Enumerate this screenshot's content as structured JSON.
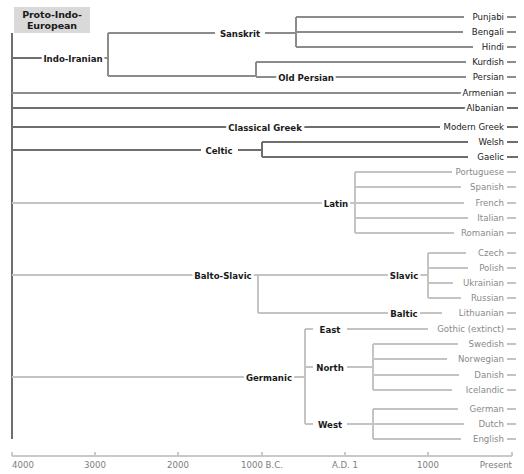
{
  "figure": {
    "root_label": "Proto-Indo-European",
    "root_box": {
      "x": 14,
      "y": 7,
      "w": 76,
      "h": 26
    },
    "colors": {
      "dark_branch": "#6e6e6e",
      "mid_branch": "#8c8c8c",
      "light_branch": "#c4c4c4",
      "dark_text": "#1a1a1a",
      "light_text": "#8a8a8a",
      "axis": "#c9c9c9",
      "axis_text": "#7d7d7d",
      "root_box_bg": "#d9d9d9"
    }
  },
  "axis": {
    "y": 456,
    "x_start": 12,
    "x_end": 512,
    "ticks": [
      {
        "label": "4000",
        "x": 12,
        "anchor": "start"
      },
      {
        "label": "3000",
        "x": 95,
        "anchor": "middle"
      },
      {
        "label": "2000",
        "x": 178,
        "anchor": "middle"
      },
      {
        "label": "1000 B.C.",
        "x": 262,
        "anchor": "middle"
      },
      {
        "label": "A.D. 1",
        "x": 345,
        "anchor": "middle"
      },
      {
        "label": "1000",
        "x": 428,
        "anchor": "middle"
      },
      {
        "label": "Present",
        "x": 512,
        "anchor": "end"
      }
    ]
  },
  "tree": {
    "spine": {
      "x": 12,
      "y_top": 33,
      "y_bottom": 439,
      "color": "dark"
    },
    "branches": [
      {
        "name": "indo-iranian-stem",
        "type": "h",
        "x1": 12,
        "x2": 46,
        "y": 58,
        "w": "dark"
      },
      {
        "name": "indo-iranian-to-fork",
        "type": "h",
        "x1": 101,
        "x2": 108,
        "y": 58,
        "w": "mid"
      },
      {
        "name": "indo-iranian-fork",
        "type": "v",
        "x": 108,
        "y1": 33,
        "y2": 76,
        "w": "mid"
      },
      {
        "name": "sanskrit-stem",
        "type": "h",
        "x1": 108,
        "x2": 215,
        "y": 33,
        "w": "mid"
      },
      {
        "name": "sanskrit-to-fork",
        "type": "h",
        "x1": 265,
        "x2": 296,
        "y": 33,
        "w": "mid"
      },
      {
        "name": "indic-fork",
        "type": "v",
        "x": 296,
        "y1": 17,
        "y2": 47,
        "w": "mid"
      },
      {
        "name": "punjabi-branch",
        "type": "h",
        "x1": 296,
        "x2": 464,
        "y": 17,
        "w": "mid"
      },
      {
        "name": "bengali-branch",
        "type": "h",
        "x1": 296,
        "x2": 463,
        "y": 32,
        "w": "mid"
      },
      {
        "name": "hindi-branch",
        "type": "h",
        "x1": 296,
        "x2": 473,
        "y": 47,
        "w": "mid"
      },
      {
        "name": "iranian-branch",
        "type": "h",
        "x1": 108,
        "x2": 256,
        "y": 76,
        "w": "mid"
      },
      {
        "name": "iranian-fork",
        "type": "v",
        "x": 256,
        "y1": 62,
        "y2": 77,
        "w": "mid"
      },
      {
        "name": "kurdish-branch",
        "type": "h",
        "x1": 256,
        "x2": 466,
        "y": 62,
        "w": "mid"
      },
      {
        "name": "old-persian-stem",
        "type": "h",
        "x1": 256,
        "x2": 283,
        "y": 77,
        "w": "mid"
      },
      {
        "name": "persian-branch",
        "type": "h",
        "x1": 330,
        "x2": 466,
        "y": 77,
        "w": "mid"
      },
      {
        "name": "armenian-branch",
        "type": "h",
        "x1": 12,
        "x2": 466,
        "y": 93,
        "w": "mid"
      },
      {
        "name": "albanian-branch",
        "type": "h",
        "x1": 12,
        "x2": 470,
        "y": 108,
        "w": "dark"
      },
      {
        "name": "classical-greek-stem",
        "type": "h",
        "x1": 12,
        "x2": 228,
        "y": 127,
        "w": "dark"
      },
      {
        "name": "modern-greek-branch",
        "type": "h",
        "x1": 303,
        "x2": 440,
        "y": 127,
        "w": "dark"
      },
      {
        "name": "celtic-stem",
        "type": "h",
        "x1": 12,
        "x2": 201,
        "y": 150,
        "w": "dark"
      },
      {
        "name": "celtic-to-fork",
        "type": "h",
        "x1": 238,
        "x2": 262,
        "y": 150,
        "w": "dark"
      },
      {
        "name": "celtic-fork",
        "type": "v",
        "x": 262,
        "y1": 142,
        "y2": 157,
        "w": "dark"
      },
      {
        "name": "welsh-branch",
        "type": "h",
        "x1": 262,
        "x2": 468,
        "y": 142,
        "w": "dark"
      },
      {
        "name": "gaelic-branch",
        "type": "h",
        "x1": 262,
        "x2": 468,
        "y": 157,
        "w": "dark"
      },
      {
        "name": "latin-stem",
        "type": "h",
        "x1": 12,
        "x2": 322,
        "y": 203,
        "w": "light"
      },
      {
        "name": "latin-to-fork",
        "type": "h",
        "x1": 350,
        "x2": 355,
        "y": 203,
        "w": "light"
      },
      {
        "name": "romance-fork",
        "type": "v",
        "x": 355,
        "y1": 172,
        "y2": 233,
        "w": "light"
      },
      {
        "name": "portuguese-branch",
        "type": "h",
        "x1": 355,
        "x2": 452,
        "y": 172,
        "w": "light"
      },
      {
        "name": "spanish-branch",
        "type": "h",
        "x1": 355,
        "x2": 461,
        "y": 187,
        "w": "light"
      },
      {
        "name": "french-branch",
        "type": "h",
        "x1": 355,
        "x2": 464,
        "y": 203,
        "w": "light"
      },
      {
        "name": "italian-branch",
        "type": "h",
        "x1": 355,
        "x2": 468,
        "y": 218,
        "w": "light"
      },
      {
        "name": "romanian-branch",
        "type": "h",
        "x1": 355,
        "x2": 454,
        "y": 233,
        "w": "light"
      },
      {
        "name": "balto-slavic-stem",
        "type": "h",
        "x1": 12,
        "x2": 194,
        "y": 275,
        "w": "light"
      },
      {
        "name": "balto-slavic-to-fork",
        "type": "h",
        "x1": 253,
        "x2": 258,
        "y": 275,
        "w": "light"
      },
      {
        "name": "balto-slavic-fork",
        "type": "v",
        "x": 258,
        "y1": 275,
        "y2": 313,
        "w": "light"
      },
      {
        "name": "slavic-stem",
        "type": "h",
        "x1": 258,
        "x2": 388,
        "y": 275,
        "w": "light"
      },
      {
        "name": "slavic-to-fork",
        "type": "h",
        "x1": 420,
        "x2": 428,
        "y": 275,
        "w": "light"
      },
      {
        "name": "slavic-fork",
        "type": "v",
        "x": 428,
        "y1": 253,
        "y2": 298,
        "w": "light"
      },
      {
        "name": "czech-branch",
        "type": "h",
        "x1": 428,
        "x2": 466,
        "y": 253,
        "w": "light"
      },
      {
        "name": "polish-branch",
        "type": "h",
        "x1": 428,
        "x2": 468,
        "y": 268,
        "w": "light"
      },
      {
        "name": "ukrainian-branch",
        "type": "h",
        "x1": 428,
        "x2": 453,
        "y": 283,
        "w": "light"
      },
      {
        "name": "russian-branch",
        "type": "h",
        "x1": 428,
        "x2": 461,
        "y": 298,
        "w": "light"
      },
      {
        "name": "baltic-stem",
        "type": "h",
        "x1": 258,
        "x2": 388,
        "y": 313,
        "w": "light"
      },
      {
        "name": "lithuanian-branch",
        "type": "h",
        "x1": 420,
        "x2": 442,
        "y": 313,
        "w": "light"
      },
      {
        "name": "germanic-stem",
        "type": "h",
        "x1": 12,
        "x2": 246,
        "y": 377,
        "w": "light"
      },
      {
        "name": "germanic-to-fork",
        "type": "h",
        "x1": 292,
        "x2": 305,
        "y": 377,
        "w": "light"
      },
      {
        "name": "germanic-fork",
        "type": "v",
        "x": 305,
        "y1": 329,
        "y2": 424,
        "w": "light"
      },
      {
        "name": "east-stem",
        "type": "h",
        "x1": 305,
        "x2": 313,
        "y": 329,
        "w": "light"
      },
      {
        "name": "gothic-branch",
        "type": "h",
        "x1": 347,
        "x2": 428,
        "y": 329,
        "w": "light"
      },
      {
        "name": "north-stem",
        "type": "h",
        "x1": 305,
        "x2": 313,
        "y": 367,
        "w": "light"
      },
      {
        "name": "north-to-fork",
        "type": "h",
        "x1": 347,
        "x2": 373,
        "y": 367,
        "w": "light"
      },
      {
        "name": "north-fork",
        "type": "v",
        "x": 373,
        "y1": 344,
        "y2": 390,
        "w": "light"
      },
      {
        "name": "swedish-branch",
        "type": "h",
        "x1": 373,
        "x2": 458,
        "y": 344,
        "w": "light"
      },
      {
        "name": "norwegian-branch",
        "type": "h",
        "x1": 373,
        "x2": 447,
        "y": 359,
        "w": "light"
      },
      {
        "name": "danish-branch",
        "type": "h",
        "x1": 373,
        "x2": 459,
        "y": 375,
        "w": "light"
      },
      {
        "name": "icelandic-branch",
        "type": "h",
        "x1": 373,
        "x2": 452,
        "y": 390,
        "w": "light"
      },
      {
        "name": "west-stem",
        "type": "h",
        "x1": 305,
        "x2": 313,
        "y": 424,
        "w": "light"
      },
      {
        "name": "west-to-fork",
        "type": "h",
        "x1": 347,
        "x2": 373,
        "y": 424,
        "w": "light"
      },
      {
        "name": "west-fork",
        "type": "v",
        "x": 373,
        "y1": 409,
        "y2": 439,
        "w": "light"
      },
      {
        "name": "german-branch",
        "type": "h",
        "x1": 373,
        "x2": 458,
        "y": 409,
        "w": "light"
      },
      {
        "name": "dutch-branch",
        "type": "h",
        "x1": 373,
        "x2": 464,
        "y": 424,
        "w": "light"
      },
      {
        "name": "english-branch",
        "type": "h",
        "x1": 373,
        "x2": 461,
        "y": 439,
        "w": "light"
      }
    ],
    "internal_nodes": [
      {
        "name": "indo-iranian",
        "label": "Indo-Iranian",
        "x": 73,
        "y": 58,
        "tone": "dark"
      },
      {
        "name": "sanskrit",
        "label": "Sanskrit",
        "x": 240,
        "y": 33,
        "tone": "dark"
      },
      {
        "name": "old-persian",
        "label": "Old Persian",
        "x": 306,
        "y": 77,
        "tone": "dark"
      },
      {
        "name": "classical-greek",
        "label": "Classical Greek",
        "x": 265,
        "y": 127,
        "tone": "dark"
      },
      {
        "name": "celtic",
        "label": "Celtic",
        "x": 219,
        "y": 150,
        "tone": "dark"
      },
      {
        "name": "latin",
        "label": "Latin",
        "x": 336,
        "y": 203,
        "tone": "dark"
      },
      {
        "name": "balto-slavic",
        "label": "Balto-Slavic",
        "x": 223,
        "y": 275,
        "tone": "dark"
      },
      {
        "name": "slavic",
        "label": "Slavic",
        "x": 404,
        "y": 275,
        "tone": "dark"
      },
      {
        "name": "baltic",
        "label": "Baltic",
        "x": 404,
        "y": 313,
        "tone": "dark"
      },
      {
        "name": "germanic",
        "label": "Germanic",
        "x": 269,
        "y": 377,
        "tone": "dark"
      },
      {
        "name": "east",
        "label": "East",
        "x": 330,
        "y": 329,
        "tone": "dark"
      },
      {
        "name": "north",
        "label": "North",
        "x": 330,
        "y": 367,
        "tone": "dark"
      },
      {
        "name": "west",
        "label": "West",
        "x": 330,
        "y": 424,
        "tone": "dark"
      }
    ],
    "leaves": [
      {
        "name": "punjabi",
        "label": "Punjabi",
        "y": 17,
        "text_x": 504,
        "tick_x1": 507,
        "tick_x2": 516,
        "tone": "mid"
      },
      {
        "name": "bengali",
        "label": "Bengali",
        "y": 32,
        "text_x": 504,
        "tick_x1": 507,
        "tick_x2": 516,
        "tone": "mid"
      },
      {
        "name": "hindi",
        "label": "Hindi",
        "y": 47,
        "text_x": 504,
        "tick_x1": 507,
        "tick_x2": 516,
        "tone": "mid"
      },
      {
        "name": "kurdish",
        "label": "Kurdish",
        "y": 62,
        "text_x": 504,
        "tick_x1": 507,
        "tick_x2": 516,
        "tone": "mid"
      },
      {
        "name": "persian",
        "label": "Persian",
        "y": 77,
        "text_x": 504,
        "tick_x1": 507,
        "tick_x2": 516,
        "tone": "mid"
      },
      {
        "name": "armenian",
        "label": "Armenian",
        "y": 93,
        "text_x": 504,
        "tick_x1": 507,
        "tick_x2": 516,
        "tone": "mid"
      },
      {
        "name": "albanian",
        "label": "Albanian",
        "y": 108,
        "text_x": 504,
        "tick_x1": 507,
        "tick_x2": 518,
        "tone": "dark"
      },
      {
        "name": "modern-greek",
        "label": "Modern Greek",
        "y": 127,
        "text_x": 504,
        "tick_x1": 507,
        "tick_x2": 518,
        "tone": "dark"
      },
      {
        "name": "welsh",
        "label": "Welsh",
        "y": 142,
        "text_x": 504,
        "tick_x1": 507,
        "tick_x2": 518,
        "tone": "dark"
      },
      {
        "name": "gaelic",
        "label": "Gaelic",
        "y": 157,
        "text_x": 504,
        "tick_x1": 507,
        "tick_x2": 518,
        "tone": "dark"
      },
      {
        "name": "portuguese",
        "label": "Portuguese",
        "y": 172,
        "text_x": 504,
        "tick_x1": 507,
        "tick_x2": 516,
        "tone": "light"
      },
      {
        "name": "spanish",
        "label": "Spanish",
        "y": 187,
        "text_x": 504,
        "tick_x1": 507,
        "tick_x2": 516,
        "tone": "light"
      },
      {
        "name": "french",
        "label": "French",
        "y": 203,
        "text_x": 504,
        "tick_x1": 507,
        "tick_x2": 516,
        "tone": "light"
      },
      {
        "name": "italian",
        "label": "Italian",
        "y": 218,
        "text_x": 504,
        "tick_x1": 507,
        "tick_x2": 516,
        "tone": "light"
      },
      {
        "name": "romanian",
        "label": "Romanian",
        "y": 233,
        "text_x": 504,
        "tick_x1": 507,
        "tick_x2": 516,
        "tone": "light"
      },
      {
        "name": "czech",
        "label": "Czech",
        "y": 253,
        "text_x": 504,
        "tick_x1": 507,
        "tick_x2": 516,
        "tone": "light"
      },
      {
        "name": "polish",
        "label": "Polish",
        "y": 268,
        "text_x": 504,
        "tick_x1": 507,
        "tick_x2": 516,
        "tone": "light"
      },
      {
        "name": "ukrainian",
        "label": "Ukrainian",
        "y": 283,
        "text_x": 504,
        "tick_x1": 507,
        "tick_x2": 516,
        "tone": "light"
      },
      {
        "name": "russian",
        "label": "Russian",
        "y": 298,
        "text_x": 504,
        "tick_x1": 507,
        "tick_x2": 516,
        "tone": "light"
      },
      {
        "name": "lithuanian",
        "label": "Lithuanian",
        "y": 313,
        "text_x": 504,
        "tick_x1": 507,
        "tick_x2": 516,
        "tone": "light"
      },
      {
        "name": "gothic",
        "label": "Gothic (extinct)",
        "y": 329,
        "text_x": 504,
        "tick_x1": 507,
        "tick_x2": 516,
        "tone": "light"
      },
      {
        "name": "swedish",
        "label": "Swedish",
        "y": 344,
        "text_x": 504,
        "tick_x1": 507,
        "tick_x2": 516,
        "tone": "light"
      },
      {
        "name": "norwegian",
        "label": "Norwegian",
        "y": 359,
        "text_x": 504,
        "tick_x1": 507,
        "tick_x2": 516,
        "tone": "light"
      },
      {
        "name": "danish",
        "label": "Danish",
        "y": 375,
        "text_x": 504,
        "tick_x1": 507,
        "tick_x2": 516,
        "tone": "light"
      },
      {
        "name": "icelandic",
        "label": "Icelandic",
        "y": 390,
        "text_x": 504,
        "tick_x1": 507,
        "tick_x2": 516,
        "tone": "light"
      },
      {
        "name": "german",
        "label": "German",
        "y": 409,
        "text_x": 504,
        "tick_x1": 507,
        "tick_x2": 516,
        "tone": "light"
      },
      {
        "name": "dutch",
        "label": "Dutch",
        "y": 424,
        "text_x": 504,
        "tick_x1": 507,
        "tick_x2": 516,
        "tone": "light"
      },
      {
        "name": "english",
        "label": "English",
        "y": 439,
        "text_x": 504,
        "tick_x1": 507,
        "tick_x2": 516,
        "tone": "light"
      }
    ]
  },
  "chart_data": {
    "type": "diagram",
    "xlabel": "",
    "x_axis_ticks": [
      "4000",
      "3000",
      "2000",
      "1000 B.C.",
      "A.D. 1",
      "1000",
      "Present"
    ],
    "root": "Proto-Indo-European",
    "branches": [
      {
        "group": "Indo-Iranian",
        "subgroups": [
          {
            "name": "Sanskrit",
            "languages": [
              "Punjabi",
              "Bengali",
              "Hindi"
            ]
          },
          {
            "name": "Iranian",
            "languages": [
              "Kurdish"
            ]
          },
          {
            "name": "Old Persian",
            "languages": [
              "Persian"
            ]
          }
        ]
      },
      {
        "group": "Armenian",
        "subgroups": []
      },
      {
        "group": "Albanian",
        "subgroups": []
      },
      {
        "group": "Classical Greek",
        "subgroups": [
          {
            "name": "",
            "languages": [
              "Modern Greek"
            ]
          }
        ]
      },
      {
        "group": "Celtic",
        "subgroups": [
          {
            "name": "",
            "languages": [
              "Welsh",
              "Gaelic"
            ]
          }
        ]
      },
      {
        "group": "Latin",
        "subgroups": [
          {
            "name": "",
            "languages": [
              "Portuguese",
              "Spanish",
              "French",
              "Italian",
              "Romanian"
            ]
          }
        ]
      },
      {
        "group": "Balto-Slavic",
        "subgroups": [
          {
            "name": "Slavic",
            "languages": [
              "Czech",
              "Polish",
              "Ukrainian",
              "Russian"
            ]
          },
          {
            "name": "Baltic",
            "languages": [
              "Lithuanian"
            ]
          }
        ]
      },
      {
        "group": "Germanic",
        "subgroups": [
          {
            "name": "East",
            "languages": [
              "Gothic (extinct)"
            ]
          },
          {
            "name": "North",
            "languages": [
              "Swedish",
              "Norwegian",
              "Danish",
              "Icelandic"
            ]
          },
          {
            "name": "West",
            "languages": [
              "German",
              "Dutch",
              "English"
            ]
          }
        ]
      }
    ]
  }
}
